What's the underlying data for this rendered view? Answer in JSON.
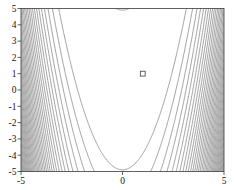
{
  "chart_data": {
    "type": "contour",
    "title": "",
    "function": "Rosenbrock: f(x,y) = (1-x)^2 + 100*(y-x^2)^2",
    "x_range": [
      -5,
      5
    ],
    "y_range": [
      -5,
      5
    ],
    "x_ticks": [
      -5,
      0,
      5
    ],
    "x_tick_labels": [
      "-5",
      "0",
      "5"
    ],
    "y_ticks": [
      5,
      4,
      3,
      2,
      1,
      0,
      -1,
      -2,
      -3,
      -4,
      -5
    ],
    "y_tick_labels": [
      "5",
      "4",
      "3",
      "2",
      "1",
      "0",
      "-1",
      "-2",
      "-3",
      "-4",
      "-5"
    ],
    "contour_levels": {
      "start": 2400,
      "step": 2400,
      "count": 37
    },
    "valley_curve": "y = x^2",
    "marker": {
      "x": 1,
      "y": 1,
      "shape": "open-square"
    },
    "grid": false,
    "colors": {
      "background": "#ffffff",
      "contour_line": "#6f6f6f",
      "axis": "#3a3a3a",
      "tick_text": "#141414",
      "marker_stroke": "#5f5f5f"
    }
  }
}
